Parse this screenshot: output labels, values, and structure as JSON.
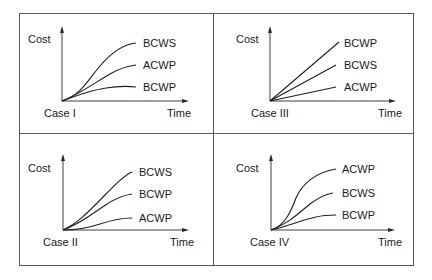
{
  "figure": {
    "quadrants": [
      {
        "id": "case-i",
        "case_label": "Case I",
        "y_label": "Cost",
        "x_label": "Time",
        "series_order_top_to_bottom": [
          "BCWS",
          "ACWP",
          "BCWP"
        ]
      },
      {
        "id": "case-iii",
        "case_label": "Case III",
        "y_label": "Cost",
        "x_label": "Time",
        "series_order_top_to_bottom": [
          "BCWP",
          "BCWS",
          "ACWP"
        ]
      },
      {
        "id": "case-ii",
        "case_label": "Case II",
        "y_label": "Cost",
        "x_label": "Time",
        "series_order_top_to_bottom": [
          "BCWS",
          "BCWP",
          "ACWP"
        ]
      },
      {
        "id": "case-iv",
        "case_label": "Case IV",
        "y_label": "Cost",
        "x_label": "Time",
        "series_order_top_to_bottom": [
          "ACWP",
          "BCWS",
          "BCWP"
        ]
      }
    ]
  },
  "labels": {
    "q1": {
      "cost": "Cost",
      "time": "Time",
      "case": "Case I",
      "s1": "BCWS",
      "s2": "ACWP",
      "s3": "BCWP"
    },
    "q3": {
      "cost": "Cost",
      "time": "Time",
      "case": "Case III",
      "s1": "BCWP",
      "s2": "BCWS",
      "s3": "ACWP"
    },
    "q2": {
      "cost": "Cost",
      "time": "Time",
      "case": "Case II",
      "s1": "BCWS",
      "s2": "BCWP",
      "s3": "ACWP"
    },
    "q4": {
      "cost": "Cost",
      "time": "Time",
      "case": "Case IV",
      "s1": "ACWP",
      "s2": "BCWS",
      "s3": "BCWP"
    }
  },
  "colors": {
    "frame": "#5a5a5a",
    "lines": "#1e1e1e",
    "text": "#1a1a1a",
    "background": "#ffffff"
  }
}
